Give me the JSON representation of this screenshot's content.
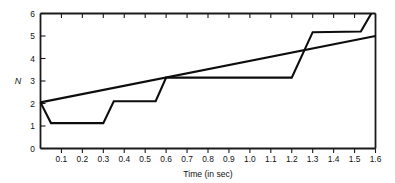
{
  "chart_data": {
    "type": "line",
    "title": "",
    "xlabel": "Time (in sec)",
    "ylabel": "N",
    "xlim": [
      0,
      1.6
    ],
    "ylim": [
      0,
      6
    ],
    "grid": false,
    "legend": "none",
    "x_ticks": [
      0.1,
      0.2,
      0.3,
      0.4,
      0.5,
      0.6,
      0.7,
      0.8,
      0.9,
      1.0,
      1.1,
      1.2,
      1.3,
      1.4,
      1.5,
      1.6
    ],
    "x_tick_labels": [
      "0.1",
      "0.2",
      "0.3",
      "0.4",
      "0.5",
      "0.6",
      "0.7",
      "0.8",
      "0.9",
      "1.0",
      "1.1",
      "1.2",
      "1.3",
      "1.4",
      "1.5",
      "1.6"
    ],
    "y_ticks": [
      0,
      1,
      2,
      3,
      4,
      5,
      6
    ],
    "y_tick_labels": [
      "0",
      "1",
      "2",
      "3",
      "4",
      "5",
      "6"
    ],
    "series": [
      {
        "name": "step-curve",
        "type": "line",
        "points": [
          [
            0.0,
            2.05
          ],
          [
            0.05,
            1.13
          ],
          [
            0.3,
            1.13
          ],
          [
            0.35,
            2.1
          ],
          [
            0.55,
            2.1
          ],
          [
            0.6,
            3.15
          ],
          [
            1.2,
            3.15
          ],
          [
            1.3,
            5.17
          ],
          [
            1.53,
            5.2
          ],
          [
            1.58,
            6.0
          ]
        ]
      },
      {
        "name": "straight-line",
        "type": "line",
        "points": [
          [
            0.0,
            2.05
          ],
          [
            1.6,
            5.0
          ]
        ]
      }
    ]
  },
  "axes": {
    "x_axis_label": "Time (in sec)",
    "y_axis_label": "N"
  }
}
